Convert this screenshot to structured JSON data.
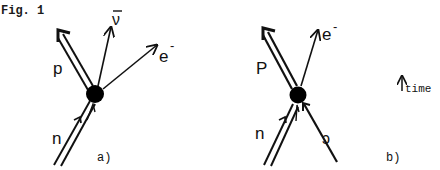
{
  "figure": {
    "label": "Fig. 1",
    "time_label": "time",
    "panels": [
      {
        "id": "a",
        "caption": "a)",
        "vertex": "blob",
        "lines": [
          {
            "particle": "n",
            "label": "n",
            "direction": "incoming",
            "style": "double"
          },
          {
            "particle": "p",
            "label": "p",
            "direction": "outgoing",
            "style": "double"
          },
          {
            "particle": "antineutrino",
            "label": "ν̄",
            "direction": "outgoing",
            "style": "single"
          },
          {
            "particle": "electron",
            "label": "e⁻",
            "direction": "outgoing",
            "style": "single"
          }
        ]
      },
      {
        "id": "b",
        "caption": "b)",
        "vertex": "blob",
        "lines": [
          {
            "particle": "n",
            "label": "n",
            "direction": "incoming",
            "style": "double"
          },
          {
            "particle": "neutrino",
            "label": "ν",
            "direction": "incoming",
            "style": "single"
          },
          {
            "particle": "p",
            "label": "p",
            "direction": "outgoing",
            "style": "double"
          },
          {
            "particle": "electron",
            "label": "e⁻",
            "direction": "outgoing",
            "style": "single"
          }
        ]
      }
    ]
  },
  "labels": {
    "a_n": "n",
    "a_p": "p",
    "a_nubar": "ν",
    "a_e": "e",
    "a_e_sup": "-",
    "a_caption": "a)",
    "b_n": "n",
    "b_p": "P",
    "b_nu": "ɔ",
    "b_e": "e",
    "b_e_sup": "-",
    "b_caption": "b)",
    "time": "time"
  }
}
